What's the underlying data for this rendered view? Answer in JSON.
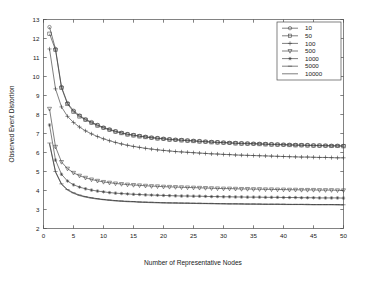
{
  "figure": {
    "background_color": "#ffffff",
    "axis_color": "#4d4d4d",
    "line_color": "#3a3a3a"
  },
  "chart_data": {
    "type": "line",
    "title": "",
    "xlabel": "Number of Representative Nodes",
    "ylabel": "Observed Event Distortion",
    "xlim": [
      0,
      50
    ],
    "ylim": [
      2,
      13
    ],
    "xticks": [
      0,
      5,
      10,
      15,
      20,
      25,
      30,
      35,
      40,
      45,
      50
    ],
    "xtick_labels": [
      "0",
      "5",
      "10",
      "15",
      "20",
      "25",
      "30",
      "35",
      "40",
      "45",
      "50"
    ],
    "yticks": [
      2,
      3,
      4,
      5,
      6,
      7,
      8,
      9,
      10,
      11,
      12,
      13
    ],
    "ytick_labels": [
      "2",
      "3",
      "4",
      "5",
      "6",
      "7",
      "8",
      "9",
      "10",
      "11",
      "12",
      "13"
    ],
    "grid": false,
    "legend_position": "upper right",
    "legend_title": "",
    "x": [
      1,
      2,
      3,
      4,
      5,
      6,
      7,
      8,
      9,
      10,
      11,
      12,
      13,
      14,
      15,
      16,
      17,
      18,
      19,
      20,
      21,
      22,
      23,
      24,
      25,
      26,
      27,
      28,
      29,
      30,
      31,
      32,
      33,
      34,
      35,
      36,
      37,
      38,
      39,
      40,
      41,
      42,
      43,
      44,
      45,
      46,
      47,
      48,
      49,
      50
    ],
    "series": [
      {
        "name": "10",
        "marker": "circle",
        "values": [
          12.6,
          11.45,
          9.45,
          8.6,
          8.2,
          7.95,
          7.75,
          7.6,
          7.45,
          7.32,
          7.22,
          7.12,
          7.04,
          6.97,
          6.92,
          6.87,
          6.83,
          6.79,
          6.76,
          6.73,
          6.7,
          6.68,
          6.66,
          6.64,
          6.62,
          6.6,
          6.58,
          6.56,
          6.54,
          6.53,
          6.51,
          6.5,
          6.49,
          6.48,
          6.47,
          6.46,
          6.45,
          6.44,
          6.43,
          6.42,
          6.41,
          6.4,
          6.39,
          6.39,
          6.38,
          6.37,
          6.37,
          6.36,
          6.36,
          6.35
        ]
      },
      {
        "name": "50",
        "marker": "square",
        "values": [
          12.25,
          11.4,
          9.4,
          8.55,
          8.15,
          7.9,
          7.72,
          7.56,
          7.42,
          7.29,
          7.19,
          7.1,
          7.02,
          6.95,
          6.9,
          6.85,
          6.81,
          6.77,
          6.74,
          6.71,
          6.68,
          6.66,
          6.64,
          6.62,
          6.6,
          6.58,
          6.56,
          6.54,
          6.53,
          6.51,
          6.5,
          6.48,
          6.47,
          6.46,
          6.45,
          6.44,
          6.43,
          6.42,
          6.41,
          6.4,
          6.39,
          6.38,
          6.38,
          6.37,
          6.36,
          6.36,
          6.35,
          6.34,
          6.34,
          6.33
        ]
      },
      {
        "name": "100",
        "marker": "plus",
        "values": [
          11.45,
          9.35,
          8.4,
          7.9,
          7.58,
          7.34,
          7.14,
          6.98,
          6.84,
          6.72,
          6.62,
          6.53,
          6.45,
          6.38,
          6.32,
          6.27,
          6.22,
          6.18,
          6.14,
          6.11,
          6.08,
          6.05,
          6.03,
          6.01,
          5.99,
          5.97,
          5.95,
          5.93,
          5.92,
          5.9,
          5.89,
          5.87,
          5.86,
          5.85,
          5.84,
          5.83,
          5.82,
          5.81,
          5.8,
          5.79,
          5.78,
          5.77,
          5.76,
          5.76,
          5.75,
          5.74,
          5.74,
          5.73,
          5.72,
          5.72
        ]
      },
      {
        "name": "500",
        "marker": "triangle-down",
        "values": [
          8.3,
          6.3,
          5.5,
          5.15,
          4.93,
          4.78,
          4.67,
          4.58,
          4.51,
          4.45,
          4.41,
          4.37,
          4.34,
          4.31,
          4.29,
          4.27,
          4.25,
          4.23,
          4.22,
          4.2,
          4.19,
          4.18,
          4.17,
          4.16,
          4.15,
          4.14,
          4.13,
          4.12,
          4.11,
          4.1,
          4.1,
          4.09,
          4.08,
          4.08,
          4.07,
          4.07,
          4.06,
          4.06,
          4.05,
          4.05,
          4.04,
          4.04,
          4.03,
          4.03,
          4.03,
          4.02,
          4.02,
          4.02,
          4.01,
          4.01
        ]
      },
      {
        "name": "1000",
        "marker": "star",
        "values": [
          7.45,
          5.6,
          4.85,
          4.5,
          4.3,
          4.18,
          4.09,
          4.02,
          3.97,
          3.93,
          3.89,
          3.86,
          3.84,
          3.82,
          3.8,
          3.79,
          3.77,
          3.76,
          3.75,
          3.74,
          3.73,
          3.72,
          3.71,
          3.71,
          3.7,
          3.7,
          3.69,
          3.68,
          3.68,
          3.67,
          3.67,
          3.66,
          3.66,
          3.65,
          3.65,
          3.65,
          3.64,
          3.64,
          3.64,
          3.63,
          3.63,
          3.63,
          3.62,
          3.62,
          3.62,
          3.61,
          3.61,
          3.61,
          3.61,
          3.6
        ]
      },
      {
        "name": "5000",
        "marker": "dash",
        "values": [
          6.5,
          5.0,
          4.35,
          4.05,
          3.88,
          3.76,
          3.68,
          3.62,
          3.57,
          3.53,
          3.5,
          3.47,
          3.45,
          3.43,
          3.42,
          3.4,
          3.39,
          3.38,
          3.37,
          3.36,
          3.35,
          3.35,
          3.34,
          3.34,
          3.33,
          3.33,
          3.32,
          3.32,
          3.31,
          3.31,
          3.3,
          3.3,
          3.3,
          3.29,
          3.29,
          3.29,
          3.28,
          3.28,
          3.28,
          3.28,
          3.27,
          3.27,
          3.27,
          3.27,
          3.26,
          3.26,
          3.26,
          3.26,
          3.26,
          3.25
        ]
      },
      {
        "name": "10000",
        "marker": "none",
        "values": [
          6.45,
          4.96,
          4.32,
          4.02,
          3.85,
          3.73,
          3.65,
          3.59,
          3.55,
          3.51,
          3.48,
          3.45,
          3.43,
          3.41,
          3.4,
          3.38,
          3.37,
          3.36,
          3.35,
          3.34,
          3.34,
          3.33,
          3.33,
          3.32,
          3.32,
          3.31,
          3.31,
          3.3,
          3.3,
          3.29,
          3.29,
          3.29,
          3.28,
          3.28,
          3.28,
          3.27,
          3.27,
          3.27,
          3.27,
          3.26,
          3.26,
          3.26,
          3.26,
          3.25,
          3.25,
          3.25,
          3.25,
          3.25,
          3.24,
          3.24
        ]
      }
    ]
  }
}
